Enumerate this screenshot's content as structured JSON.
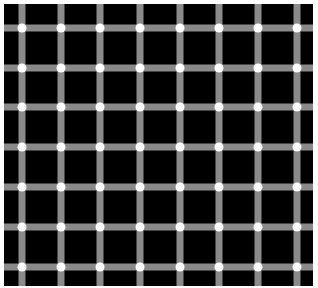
{
  "image": {
    "subject": "scintillating grid illusion",
    "colors": {
      "background": "#ffffff",
      "field": "#000000",
      "bar": "#8a8a8a",
      "dot": "#ffffff"
    },
    "field_bounds": {
      "x": 4,
      "y": 4,
      "width": 309,
      "height": 282
    },
    "bar_width": 7,
    "dot_radius": 4.5,
    "columns_x": [
      22,
      61,
      100,
      140,
      180,
      219,
      258,
      297
    ],
    "rows_y": [
      28,
      68,
      107,
      147,
      187,
      227,
      267
    ]
  }
}
